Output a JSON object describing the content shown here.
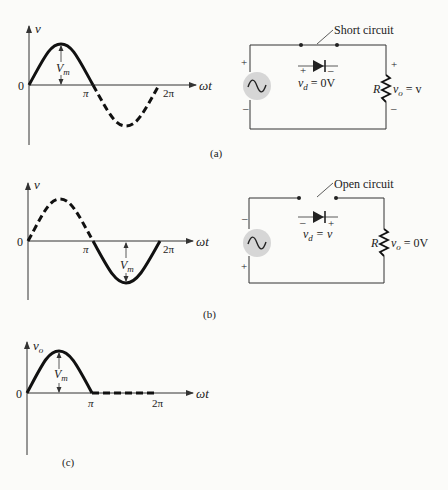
{
  "figure": {
    "panels": [
      {
        "id": "a",
        "caption": "(a)",
        "plot": {
          "y_axis_label": "v",
          "x_axis_label": "ωt",
          "origin_label": "0",
          "tick_pi": "π",
          "tick_2pi": "2π",
          "amplitude_label": "V",
          "amplitude_sub": "m",
          "solid_segment": "0 to π (positive half-cycle)",
          "dashed_segment": "π to 2π (negative half-cycle)"
        },
        "circuit": {
          "annotation": "Short circuit",
          "source_top_polarity": "+",
          "source_bottom_polarity": "–",
          "diode_left_polarity": "+",
          "diode_right_polarity": "–",
          "diode_v": "v",
          "diode_v_sub": "d",
          "diode_eq": " = 0V",
          "resistor_label": "R",
          "vo": "v",
          "vo_sub": "o",
          "vo_eq": " = v",
          "resistor_top_polarity": "+",
          "resistor_bottom_polarity": "–"
        }
      },
      {
        "id": "b",
        "caption": "(b)",
        "plot": {
          "y_axis_label": "v",
          "x_axis_label": "ωt",
          "origin_label": "0",
          "tick_pi": "π",
          "tick_2pi": "2π",
          "amplitude_label": "V",
          "amplitude_sub": "m",
          "dashed_segment": "0 to π (positive half-cycle)",
          "solid_segment": "π to 2π (negative half-cycle)"
        },
        "circuit": {
          "annotation": "Open circuit",
          "source_top_polarity": "–",
          "source_bottom_polarity": "+",
          "diode_left_polarity": "–",
          "diode_right_polarity": "+",
          "diode_v": "v",
          "diode_v_sub": "d",
          "diode_eq": " = v",
          "resistor_label": "R",
          "vo": "v",
          "vo_sub": "o",
          "vo_eq": " = 0V"
        }
      },
      {
        "id": "c",
        "caption": "(c)",
        "plot": {
          "y_axis_label": "v",
          "y_axis_sub": "o",
          "x_axis_label": "ωt",
          "origin_label": "0",
          "tick_pi": "π",
          "tick_2pi": "2π",
          "amplitude_label": "V",
          "amplitude_sub": "m",
          "solid_segment": "0 to π (positive half-cycle)",
          "dashed_segment": "π to 2π (zero output)"
        }
      }
    ]
  }
}
